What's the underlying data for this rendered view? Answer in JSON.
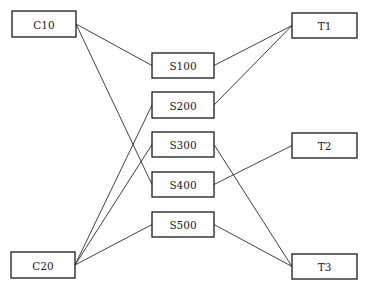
{
  "diagram": {
    "nodes": [
      {
        "id": "C10",
        "label": "C10",
        "group": "left"
      },
      {
        "id": "C20",
        "label": "C20",
        "group": "left"
      },
      {
        "id": "S100",
        "label": "S100",
        "group": "middle"
      },
      {
        "id": "S200",
        "label": "S200",
        "group": "middle"
      },
      {
        "id": "S300",
        "label": "S300",
        "group": "middle"
      },
      {
        "id": "S400",
        "label": "S400",
        "group": "middle"
      },
      {
        "id": "S500",
        "label": "S500",
        "group": "middle"
      },
      {
        "id": "T1",
        "label": "T1",
        "group": "right"
      },
      {
        "id": "T2",
        "label": "T2",
        "group": "right"
      },
      {
        "id": "T3",
        "label": "T3",
        "group": "right"
      }
    ],
    "edges": [
      {
        "from": "C10",
        "to": "S100"
      },
      {
        "from": "C10",
        "to": "S400"
      },
      {
        "from": "C20",
        "to": "S200"
      },
      {
        "from": "C20",
        "to": "S300"
      },
      {
        "from": "C20",
        "to": "S500"
      },
      {
        "from": "S100",
        "to": "T1"
      },
      {
        "from": "S200",
        "to": "T1"
      },
      {
        "from": "S300",
        "to": "T3"
      },
      {
        "from": "S400",
        "to": "T2"
      },
      {
        "from": "S500",
        "to": "T3"
      }
    ]
  }
}
